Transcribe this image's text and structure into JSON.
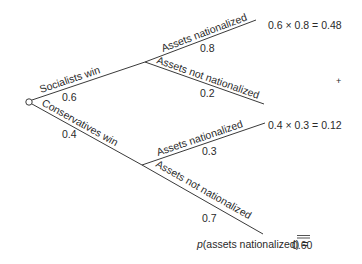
{
  "diagram": {
    "type": "probability-tree",
    "root": {
      "branches": [
        {
          "label": "Socialists win",
          "probability": "0.6",
          "children": [
            {
              "label": "Assets nationalized",
              "probability": "0.8",
              "result": "0.6 × 0.8 = 0.48"
            },
            {
              "label": "Assets not nationalized",
              "probability": "0.2"
            }
          ]
        },
        {
          "label": "Conservatives win",
          "probability": "0.4",
          "children": [
            {
              "label": "Assets nationalized",
              "probability": "0.3",
              "result": "0.4 × 0.3 = 0.12"
            },
            {
              "label": "Assets not nationalized",
              "probability": "0.7"
            }
          ]
        }
      ]
    },
    "sum_sign": "+",
    "total": {
      "p_symbol": "p",
      "label": "(assets nationalized) =",
      "value": "0.60"
    }
  }
}
